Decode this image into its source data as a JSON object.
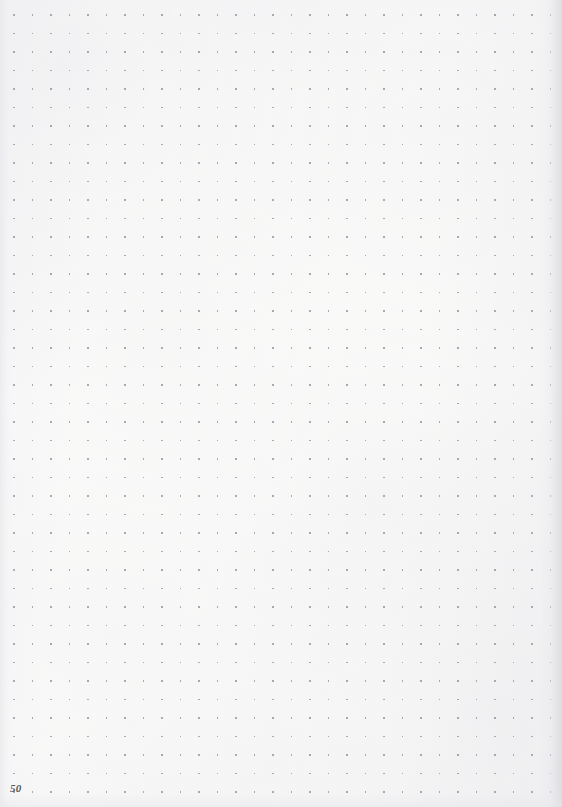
{
  "page": {
    "kind": "dot-grid-notebook-page",
    "page_number": "50",
    "width": 562,
    "height": 807,
    "paper_color": "#fbfbfa",
    "content_text": "",
    "has_written_content": false
  },
  "dot_grid": {
    "dot_color": "#8e8f9b",
    "dot_size_px": 1.6,
    "spacing_px": 18.5,
    "origin_x": 14,
    "origin_y": 15,
    "columns": 30,
    "rows": 43
  },
  "page_number_block": {
    "value": "50",
    "position": "bottom-left",
    "color": "#4a4a52"
  },
  "edges": {
    "right_shadow_color": "#d6d6db",
    "left_shadow_color": "#e2e2e7",
    "bottom_shadow_color": "#e7e7eb"
  }
}
